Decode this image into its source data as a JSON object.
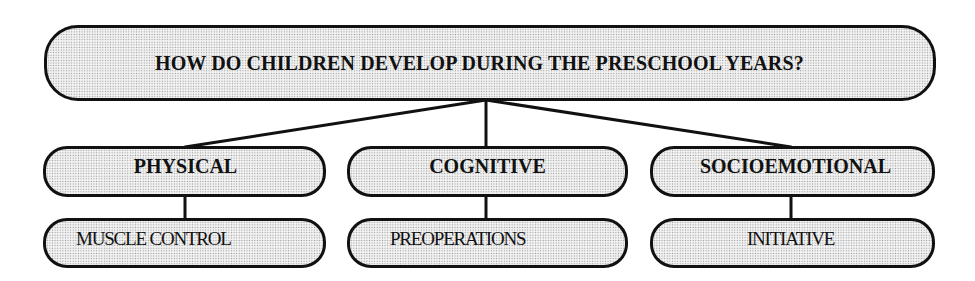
{
  "diagram": {
    "type": "hierarchy-tree",
    "root": {
      "label": "HOW DO CHILDREN DEVELOP DURING THE PRESCHOOL YEARS?"
    },
    "branches": [
      {
        "label": "PHYSICAL",
        "child": {
          "label": "MUSCLE CONTROL"
        }
      },
      {
        "label": "COGNITIVE",
        "child": {
          "label": "PREOPERATIONS"
        }
      },
      {
        "label": "SOCIOEMOTIONAL",
        "child": {
          "label": "INITIATIVE"
        }
      }
    ],
    "colors": {
      "stroke": "#111111",
      "fill": "#f4f4f4",
      "dot_pattern": "#9a9a9a",
      "background": "#ffffff"
    }
  }
}
